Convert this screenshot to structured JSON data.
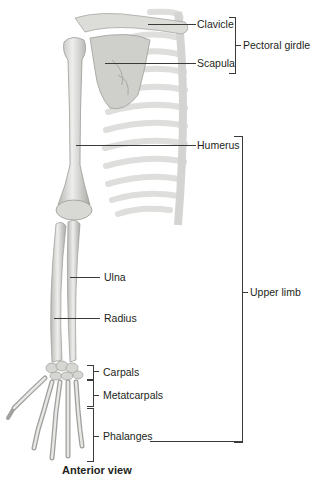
{
  "figure": {
    "view_caption": "Anterior view",
    "labels": {
      "clavicle": "Clavicle",
      "scapula": "Scapula",
      "humerus": "Humerus",
      "ulna": "Ulna",
      "radius": "Radius",
      "carpals": "Carpals",
      "metacarpals": "Metatcarpals",
      "phalanges": "Phalanges"
    },
    "groups": {
      "pectoral_girdle": "Pectoral girdle",
      "upper_limb": "Upper limb"
    },
    "colors": {
      "bone_fill": "#e6e6e4",
      "bone_shade": "#b9b9b6",
      "rib_fill": "#f0f0ef",
      "line": "#3a3a3a",
      "text": "#231f20"
    }
  }
}
